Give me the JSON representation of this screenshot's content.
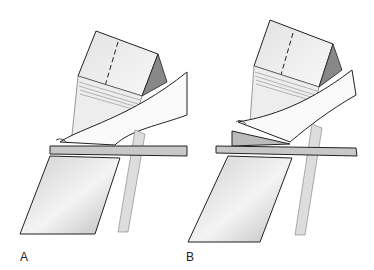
{
  "panels": [
    {
      "label": "A",
      "description": "Foot on flat board over sliding cassette"
    },
    {
      "label": "B",
      "description": "Foot on wedge block over sliding cassette"
    }
  ]
}
